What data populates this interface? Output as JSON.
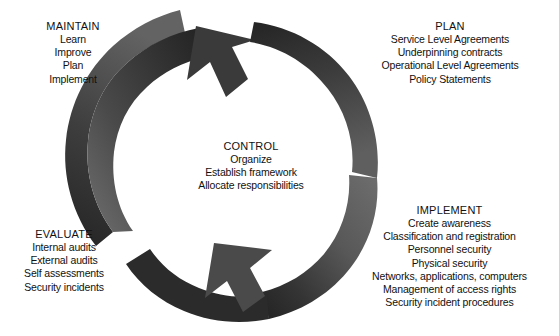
{
  "diagram": {
    "title_strip": "",
    "background_color": "#ffffff",
    "arrow_dark_color": "#3b3b3b",
    "arrow_darkest_color": "#262626",
    "arrow_mid_color": "#555555",
    "arrow_light_color": "#6e6e6e",
    "text_color": "#111111",
    "type": "cycle"
  },
  "stages": {
    "maintain": {
      "heading": "MAINTAIN",
      "items": [
        "Learn",
        "Improve",
        "Plan",
        "Implement"
      ]
    },
    "plan": {
      "heading": "PLAN",
      "items": [
        "Service Level Agreements",
        "Underpinning contracts",
        "Operational Level Agreements",
        "Policy Statements"
      ]
    },
    "control": {
      "heading": "CONTROL",
      "items": [
        "Organize",
        "Establish framework",
        "Allocate responsibilities"
      ]
    },
    "evaluate": {
      "heading": "EVALUATE",
      "items": [
        "Internal audits",
        "External audits",
        "Self assessments",
        "Security incidents"
      ]
    },
    "implement": {
      "heading": "IMPLEMENT",
      "items": [
        "Create awareness",
        "Classification and registration",
        "Personnel security",
        "Physical security",
        "Networks, applications, computers",
        "Management of access rights",
        "Security incident procedures"
      ]
    }
  },
  "arrows": {
    "upper": {
      "name": "clockwise-upper-arrow",
      "direction": "evaluate-to-plan-clockwise"
    },
    "lower": {
      "name": "clockwise-lower-arrow",
      "direction": "plan-to-evaluate-clockwise"
    }
  }
}
